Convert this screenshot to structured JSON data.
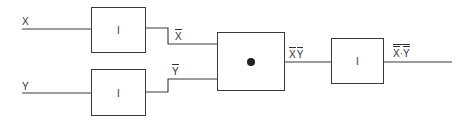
{
  "diagram": {
    "type": "logic-circuit",
    "inputs": [
      {
        "id": "x",
        "label": "X"
      },
      {
        "id": "y",
        "label": "Y"
      }
    ],
    "gates": [
      {
        "id": "inv1",
        "type": "inverter",
        "symbol": "I",
        "input": "X",
        "output_label": "X"
      },
      {
        "id": "inv2",
        "type": "inverter",
        "symbol": "I",
        "input": "Y",
        "output_label": "Y"
      },
      {
        "id": "and1",
        "type": "and",
        "symbol": "•",
        "output_label_a": "X",
        "output_label_b": "Y"
      },
      {
        "id": "inv3",
        "type": "inverter",
        "symbol": "I",
        "output_label_a": "X",
        "output_label_dot": "·",
        "output_label_b": "Y"
      }
    ],
    "wire_labels": {
      "x_bar": "X",
      "y_bar": "Y",
      "and_out_x": "X",
      "and_out_y": "Y",
      "final_x": "X",
      "final_dot": "·",
      "final_y": "Y"
    },
    "colors": {
      "line": "#3a3a3a",
      "background": "#ffffff"
    }
  }
}
